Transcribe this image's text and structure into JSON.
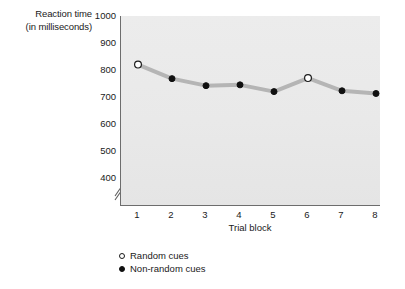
{
  "chart_data": {
    "type": "line",
    "title": "",
    "xlabel": "Trial block",
    "ylabel_lines": [
      "Reaction time",
      "(in milliseconds)"
    ],
    "ylabel": "Reaction time (in milliseconds)",
    "categories": [
      "1",
      "2",
      "3",
      "4",
      "5",
      "6",
      "7",
      "8"
    ],
    "x": [
      1,
      2,
      3,
      4,
      5,
      6,
      7,
      8
    ],
    "ylim": [
      400,
      1000
    ],
    "axis_break": true,
    "axis_break_below": 400,
    "grid": false,
    "legend_position": "below-left",
    "y_ticks": [
      1000,
      900,
      800,
      700,
      600,
      500,
      400
    ],
    "series": [
      {
        "name": "Reaction time",
        "values": [
          820,
          768,
          742,
          745,
          720,
          770,
          723,
          713
        ],
        "line_color": "#b5b5b5",
        "line_width": 4
      }
    ],
    "point_types": [
      "random",
      "non-random",
      "non-random",
      "non-random",
      "non-random",
      "random",
      "non-random",
      "non-random"
    ],
    "legend": [
      {
        "key": "random",
        "label": "Random cues",
        "marker": "open-circle"
      },
      {
        "key": "non-random",
        "label": "Non-random cues",
        "marker": "filled-circle"
      }
    ],
    "colors": {
      "plot_background": "#ebebeb",
      "axis": "#6d6d6d",
      "line": "#b5b5b5",
      "marker_fill": "#101010",
      "marker_open_fill": "#ffffff",
      "text": "#1a1a1a",
      "page_background": "#ffffff"
    }
  }
}
